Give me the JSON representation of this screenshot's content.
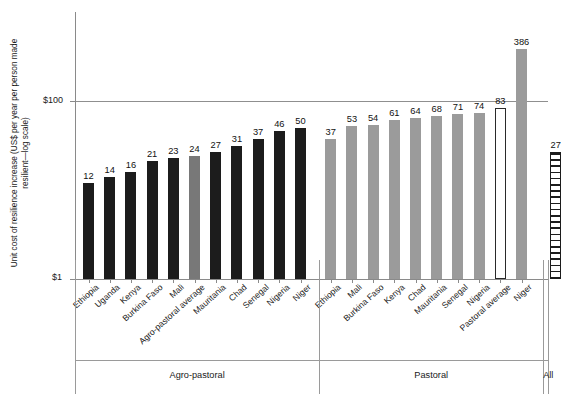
{
  "chart_data": {
    "type": "bar",
    "title": "",
    "xlabel": "",
    "ylabel": "Unit cost of resilience increase (US$ per year per person made resilient—log scale)",
    "yscale": "log",
    "ylim": [
      1,
      1000
    ],
    "ytick_labels": [
      "$1",
      "$100"
    ],
    "gridlines": [
      "$100"
    ],
    "categories": [
      "Ethiopia",
      "Uganda",
      "Kenya",
      "Burkina Faso",
      "Mali",
      "Agro-pastoral average",
      "Mauritania",
      "Chad",
      "Senegal",
      "Nigeria",
      "Niger",
      "Ethiopia",
      "Mali",
      "Burkina Faso",
      "Kenya",
      "Chad",
      "Mauritania",
      "Senegal",
      "Nigeria",
      "Pastoral average",
      "Niger",
      "All"
    ],
    "values": [
      12,
      14,
      16,
      21,
      23,
      24,
      27,
      31,
      37,
      46,
      50,
      37,
      53,
      54,
      61,
      64,
      68,
      71,
      74,
      83,
      386,
      27
    ],
    "styles": [
      "dark",
      "dark",
      "dark",
      "dark",
      "dark",
      "mid",
      "dark",
      "dark",
      "dark",
      "dark",
      "dark",
      "light",
      "light",
      "light",
      "light",
      "light",
      "light",
      "light",
      "light",
      "open",
      "light",
      "hatch"
    ],
    "groups": [
      {
        "name": "Agro-pastoral",
        "start": 0,
        "end": 10
      },
      {
        "name": "Pastoral",
        "start": 11,
        "end": 20
      },
      {
        "name": "All",
        "start": 21,
        "end": 21
      }
    ],
    "colors": {
      "dark": "#1c1c1c",
      "mid": "#787878",
      "light": "#9b9b9b",
      "open": "#ffffff",
      "hatch": "#1c1c1c",
      "axis": "#8a8a8a",
      "grid": "#8f8f8f"
    }
  }
}
